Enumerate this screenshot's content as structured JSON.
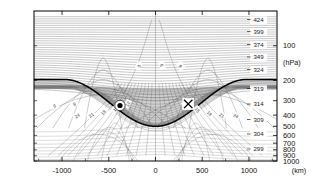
{
  "chart_data": {
    "type": "line",
    "title": "",
    "subtitle": "",
    "xlabel": "(km)",
    "ylabel": "(hPa)",
    "xlim": [
      -1300,
      1300
    ],
    "ylim_pressure": [
      1000,
      50
    ],
    "grid": true,
    "legend_position": "none",
    "x_axis": {
      "label": "(km)",
      "ticks": [
        -1000,
        -500,
        0,
        500,
        1000
      ],
      "tick_labels": [
        "-1000",
        "-500",
        "0",
        "500",
        "1000"
      ],
      "minor_ticks": [
        -1250,
        -750,
        -250,
        250,
        750,
        1250
      ]
    },
    "y_axis_pressure": {
      "label": "(hPa)",
      "ticks": [
        100,
        200,
        300,
        400,
        500,
        600,
        700,
        800,
        900,
        1000
      ],
      "tick_labels": [
        "100",
        "200",
        "300",
        "400",
        "500",
        "600",
        "700",
        "800",
        "900",
        "1000"
      ]
    },
    "y_axis_theta": {
      "label": "K",
      "tick_labels": [
        "424",
        "399",
        "374",
        "349",
        "324",
        "319",
        "314",
        "309",
        "304",
        "299"
      ],
      "values": [
        424,
        399,
        374,
        349,
        324,
        319,
        314,
        309,
        304,
        299
      ],
      "note": "25 K spacing above 324 K, 5 K spacing below 324 K"
    },
    "tropopause": {
      "style": "bold-black-curve",
      "min_pressure_hPa": 200,
      "max_pressure_hPa": 500,
      "fold_center_km": 0
    },
    "shaded_region": {
      "label": "stratospheric air / tropopause fold",
      "color": "#8d8d8d"
    },
    "markers": [
      {
        "name": "filled-circle-marker",
        "symbol": "circle",
        "x_km": -380,
        "pressure_hPa": 330
      },
      {
        "name": "cross-marker",
        "symbol": "x",
        "x_km": 350,
        "pressure_hPa": 320
      }
    ],
    "contour_labels": [
      "12",
      "15",
      "18",
      "21",
      "24",
      "12",
      "15",
      "18",
      "21",
      "24",
      "6",
      "9",
      "3",
      "6",
      "9",
      "3"
    ]
  },
  "axes": {
    "x_unit": "(km)",
    "y_unit": "(hPa)"
  },
  "colors": {
    "frame": "#000000",
    "grid": "#9a9a9a",
    "isentrope": "#6f6f6f",
    "contour": "#555555",
    "shade_dark": "#8a8a8a",
    "shade_light": "#c9c9c9",
    "tropopause": "#000000",
    "background": "#ffffff"
  }
}
